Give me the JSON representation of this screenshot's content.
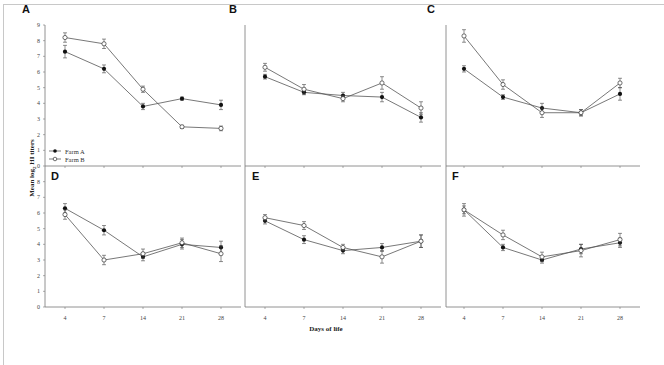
{
  "chart_data": {
    "type": "line",
    "ylabel": "Mean log2 HI titers",
    "xlabel": "Days of life",
    "x": [
      4,
      7,
      14,
      21,
      28
    ],
    "x_tick_labels": [
      "4",
      "7",
      "14",
      "21",
      "28"
    ],
    "ylim": [
      0,
      9
    ],
    "y_ticks": [
      0,
      1,
      2,
      3,
      4,
      5,
      6,
      7,
      8,
      9
    ],
    "grid": false,
    "legend": {
      "position": "lower-left of panel A",
      "entries": [
        {
          "name": "Farm A",
          "marker": "filled-circle"
        },
        {
          "name": "Farm B",
          "marker": "open-circle"
        }
      ]
    },
    "panels": [
      {
        "label": "A",
        "series": [
          {
            "name": "Farm A",
            "values": [
              7.3,
              6.2,
              3.8,
              4.3,
              3.9
            ],
            "err": [
              0.4,
              0.25,
              0.2,
              0.1,
              0.3
            ]
          },
          {
            "name": "Farm B",
            "values": [
              8.2,
              7.8,
              4.9,
              2.5,
              2.4
            ],
            "err": [
              0.3,
              0.3,
              0.2,
              0.1,
              0.15
            ]
          }
        ]
      },
      {
        "label": "B",
        "series": [
          {
            "name": "Farm A",
            "values": [
              5.7,
              4.7,
              4.5,
              4.4,
              3.1
            ],
            "err": [
              0.15,
              0.15,
              0.2,
              0.3,
              0.3
            ]
          },
          {
            "name": "Farm B",
            "values": [
              6.3,
              4.9,
              4.3,
              5.3,
              3.7
            ],
            "err": [
              0.25,
              0.3,
              0.2,
              0.4,
              0.4
            ]
          }
        ]
      },
      {
        "label": "C",
        "series": [
          {
            "name": "Farm A",
            "values": [
              6.2,
              4.4,
              3.7,
              3.4,
              4.6
            ],
            "err": [
              0.2,
              0.15,
              0.3,
              0.2,
              0.4
            ]
          },
          {
            "name": "Farm B",
            "values": [
              8.3,
              5.2,
              3.4,
              3.4,
              5.3
            ],
            "err": [
              0.4,
              0.3,
              0.3,
              0.2,
              0.3
            ]
          }
        ]
      },
      {
        "label": "D",
        "series": [
          {
            "name": "Farm A",
            "values": [
              6.3,
              4.9,
              3.2,
              4.0,
              3.8
            ],
            "err": [
              0.3,
              0.3,
              0.25,
              0.3,
              0.4
            ]
          },
          {
            "name": "Farm B",
            "values": [
              5.9,
              3.0,
              3.4,
              4.1,
              3.4
            ],
            "err": [
              0.3,
              0.3,
              0.3,
              0.3,
              0.5
            ]
          }
        ]
      },
      {
        "label": "E",
        "series": [
          {
            "name": "Farm A",
            "values": [
              5.5,
              4.3,
              3.6,
              3.8,
              4.2
            ],
            "err": [
              0.2,
              0.25,
              0.2,
              0.25,
              0.4
            ]
          },
          {
            "name": "Farm B",
            "values": [
              5.7,
              5.2,
              3.8,
              3.2,
              4.2
            ],
            "err": [
              0.2,
              0.25,
              0.2,
              0.4,
              0.4
            ]
          }
        ]
      },
      {
        "label": "F",
        "series": [
          {
            "name": "Farm A",
            "values": [
              6.2,
              3.8,
              3.0,
              3.7,
              4.1
            ],
            "err": [
              0.25,
              0.2,
              0.2,
              0.3,
              0.3
            ]
          },
          {
            "name": "Farm B",
            "values": [
              6.2,
              4.6,
              3.2,
              3.6,
              4.3
            ],
            "err": [
              0.4,
              0.3,
              0.3,
              0.4,
              0.4
            ]
          }
        ]
      }
    ]
  },
  "labels": {
    "ylabel_prefix": "Mean log",
    "ylabel_sub": "2",
    "ylabel_suffix": " HI titers",
    "xlabel": "Days of life",
    "legend_farm_a": "Farm A",
    "legend_farm_b": "Farm B"
  }
}
